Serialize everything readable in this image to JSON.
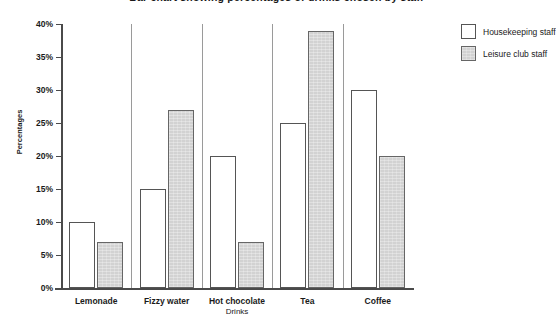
{
  "chart_data": {
    "type": "bar",
    "title": "Bar chart showing percentages of drinks chosen by staff",
    "xlabel": "Drinks",
    "ylabel": "Percentages",
    "categories": [
      "Lemonade",
      "Fizzy water",
      "Hot chocolate",
      "Tea",
      "Coffee"
    ],
    "series": [
      {
        "name": "Housekeeping staff",
        "values": [
          10,
          15,
          20,
          25,
          30
        ],
        "fill": "#ffffff"
      },
      {
        "name": "Leisure club staff",
        "values": [
          7,
          27,
          7,
          39,
          20
        ],
        "fill": "#d2d2d2"
      }
    ],
    "ylim": [
      0,
      40
    ],
    "ytick_values": [
      0,
      5,
      10,
      15,
      20,
      25,
      30,
      35,
      40
    ],
    "ytick_labels": [
      "0%",
      "5%",
      "10%",
      "15%",
      "20%",
      "25%",
      "30%",
      "35%",
      "40%"
    ],
    "grid": false,
    "legend_position": "top-right-outside",
    "value_suffix": "%"
  }
}
